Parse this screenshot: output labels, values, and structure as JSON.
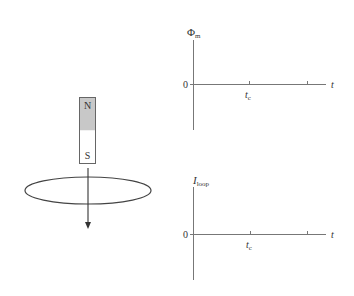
{
  "magnet": {
    "north_label": "N",
    "south_label": "S",
    "north_color": "#c8c8c8",
    "south_color": "#ffffff",
    "motion": "downward through loop"
  },
  "loop": {
    "description": "horizontal conducting loop"
  },
  "graphs": [
    {
      "id": "flux",
      "y_label_main": "Φ",
      "y_label_sub": "m",
      "x_label": "t",
      "origin_label": "0",
      "tick_label_main": "t",
      "tick_label_sub": "c"
    },
    {
      "id": "current",
      "y_label_main": "I",
      "y_label_sub": "loop",
      "x_label": "t",
      "origin_label": "0",
      "tick_label_main": "t",
      "tick_label_sub": "c"
    }
  ],
  "colors": {
    "line": "#555555",
    "text": "#333333"
  }
}
